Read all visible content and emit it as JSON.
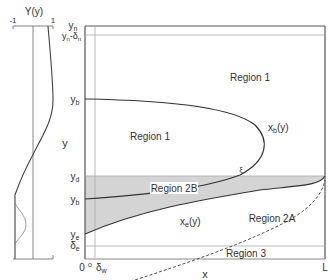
{
  "profile_plot": {
    "title": "Y(y)",
    "x_ticks": [
      "-1",
      "1"
    ],
    "y_label": "y"
  },
  "main_plot": {
    "x_label": "x",
    "x_ticks": [
      "0",
      "δ",
      "w",
      "L"
    ],
    "origin_label": "0",
    "y_ticks": {
      "yn": "y",
      "yn_sub": "n",
      "yn_delta": "y",
      "yn_delta_sub": "n",
      "yn_delta_mid": "-δ",
      "yn_delta_sub2": "n",
      "yb_prime": "y",
      "yb_prime_sub": "b",
      "yd": "y",
      "yd_sub": "d",
      "yb": "y",
      "yb_sub": "b",
      "ye": "y",
      "ye_sub": "e",
      "delta_e": "δ",
      "delta_e_sub": "e"
    },
    "delta_w": "δ",
    "delta_w_sub": "w",
    "L": "L",
    "regions": {
      "r1_top": "Region 1",
      "r1_mid": "Region 1",
      "r2b": "Region 2B",
      "r2a": "Region 2A",
      "r3": "Region 3"
    },
    "curves": {
      "xb": "x",
      "xb_sub": "b",
      "xb_arg": "(y)",
      "xe": "x",
      "xe_sub": "e",
      "xe_arg": "(y)",
      "xi": "ξ"
    },
    "colors": {
      "frame": "#555555",
      "shade": "#d4d4d4",
      "curve": "#333333",
      "guide": "#aaaaaa"
    }
  }
}
